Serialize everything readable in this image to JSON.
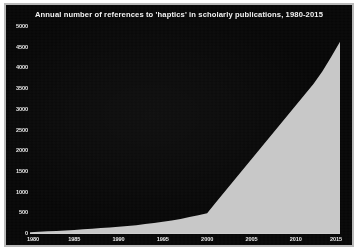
{
  "chart_data": {
    "type": "area",
    "title": "Annual number of references to 'haptics' in scholarly publications, 1980-2015",
    "xlabel": "",
    "ylabel": "",
    "xlim": [
      1980,
      2015
    ],
    "ylim": [
      0,
      5000
    ],
    "grid": false,
    "legend": null,
    "x_ticks": [
      "1980",
      "1985",
      "1990",
      "1995",
      "2000",
      "2005",
      "2010",
      "2015"
    ],
    "y_ticks": [
      "0",
      "500",
      "1000",
      "1500",
      "2000",
      "2500",
      "3000",
      "3500",
      "4000",
      "4500",
      "5000"
    ],
    "x": [
      1980,
      1981,
      1982,
      1983,
      1984,
      1985,
      1986,
      1987,
      1988,
      1989,
      1990,
      1991,
      1992,
      1993,
      1994,
      1995,
      1996,
      1997,
      1998,
      1999,
      2000,
      2001,
      2002,
      2003,
      2004,
      2005,
      2006,
      2007,
      2008,
      2009,
      2010,
      2011,
      2012,
      2013,
      2014,
      2015
    ],
    "values": [
      20,
      30,
      40,
      50,
      60,
      75,
      90,
      105,
      120,
      135,
      150,
      170,
      190,
      215,
      240,
      270,
      300,
      340,
      385,
      430,
      480,
      740,
      1000,
      1260,
      1520,
      1780,
      2040,
      2300,
      2560,
      2820,
      3080,
      3340,
      3600,
      3900,
      4250,
      4620
    ],
    "series_name": "references to 'haptics'",
    "colors": {
      "background": "#070707",
      "area_fill": "#c8c8c8",
      "axis": "#cfcfcf",
      "text": "#e8e8e8",
      "frame": "#b9b9b9",
      "page": "#ffffff"
    }
  }
}
